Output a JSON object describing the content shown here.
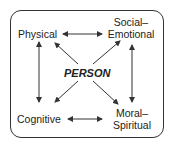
{
  "diagram": {
    "center": "PERSON",
    "nodes": {
      "physical": "Physical",
      "social_line1": "Social–",
      "social_line2": "Emotional",
      "cognitive": "Cognitive",
      "moral_line1": "Moral–",
      "moral_line2": "Spiritual"
    },
    "connections": [
      [
        "Physical",
        "Social–Emotional"
      ],
      [
        "Physical",
        "Cognitive"
      ],
      [
        "Social–Emotional",
        "Moral–Spiritual"
      ],
      [
        "Cognitive",
        "Moral–Spiritual"
      ],
      [
        "PERSON",
        "Physical"
      ],
      [
        "PERSON",
        "Social–Emotional"
      ],
      [
        "PERSON",
        "Cognitive"
      ],
      [
        "PERSON",
        "Moral–Spiritual"
      ]
    ],
    "colors": {
      "stroke": "#333333",
      "text": "#222222",
      "background": "#ffffff"
    }
  }
}
